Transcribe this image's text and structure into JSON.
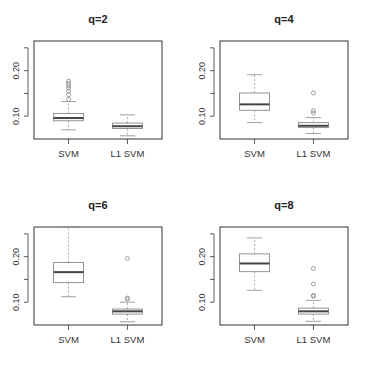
{
  "chart_data": [
    {
      "type": "boxplot",
      "title": "q=2",
      "categories": [
        "SVM",
        "L1 SVM"
      ],
      "ylim": [
        0.05,
        0.265
      ],
      "yticks": [
        0.1,
        0.15,
        0.2,
        0.25
      ],
      "ytick_labels": [
        "0.10",
        "",
        "0.20",
        ""
      ],
      "series": [
        {
          "name": "SVM",
          "whisker_low": 0.07,
          "q1": 0.09,
          "median": 0.096,
          "q3": 0.106,
          "whisker_high": 0.132,
          "outliers": [
            0.137,
            0.147,
            0.155,
            0.162,
            0.167,
            0.172,
            0.177
          ]
        },
        {
          "name": "L1 SVM",
          "whisker_low": 0.057,
          "q1": 0.073,
          "median": 0.078,
          "q3": 0.085,
          "whisker_high": 0.103,
          "outliers": []
        }
      ]
    },
    {
      "type": "boxplot",
      "title": "q=4",
      "categories": [
        "SVM",
        "L1 SVM"
      ],
      "ylim": [
        0.05,
        0.265
      ],
      "yticks": [
        0.1,
        0.15,
        0.2,
        0.25
      ],
      "ytick_labels": [
        "0.10",
        "",
        "0.20",
        ""
      ],
      "series": [
        {
          "name": "SVM",
          "whisker_low": 0.086,
          "q1": 0.113,
          "median": 0.126,
          "q3": 0.151,
          "whisker_high": 0.191,
          "outliers": []
        },
        {
          "name": "L1 SVM",
          "whisker_low": 0.062,
          "q1": 0.075,
          "median": 0.079,
          "q3": 0.086,
          "whisker_high": 0.097,
          "outliers": [
            0.107,
            0.112,
            0.151
          ]
        }
      ]
    },
    {
      "type": "boxplot",
      "title": "q=6",
      "categories": [
        "SVM",
        "L1 SVM"
      ],
      "ylim": [
        0.05,
        0.265
      ],
      "yticks": [
        0.1,
        0.15,
        0.2,
        0.25
      ],
      "ytick_labels": [
        "0.10",
        "",
        "0.20",
        ""
      ],
      "series": [
        {
          "name": "SVM",
          "whisker_low": 0.112,
          "q1": 0.143,
          "median": 0.166,
          "q3": 0.187,
          "whisker_high": 0.265,
          "outliers": []
        },
        {
          "name": "L1 SVM",
          "whisker_low": 0.057,
          "q1": 0.074,
          "median": 0.08,
          "q3": 0.085,
          "whisker_high": 0.1,
          "outliers": [
            0.107,
            0.109,
            0.196
          ]
        }
      ]
    },
    {
      "type": "boxplot",
      "title": "q=8",
      "categories": [
        "SVM",
        "L1 SVM"
      ],
      "ylim": [
        0.05,
        0.265
      ],
      "yticks": [
        0.1,
        0.15,
        0.2,
        0.25
      ],
      "ytick_labels": [
        "0.10",
        "",
        "0.20",
        ""
      ],
      "series": [
        {
          "name": "SVM",
          "whisker_low": 0.126,
          "q1": 0.167,
          "median": 0.185,
          "q3": 0.206,
          "whisker_high": 0.241,
          "outliers": []
        },
        {
          "name": "L1 SVM",
          "whisker_low": 0.058,
          "q1": 0.074,
          "median": 0.08,
          "q3": 0.087,
          "whisker_high": 0.104,
          "outliers": [
            0.113,
            0.115,
            0.14,
            0.174
          ]
        }
      ]
    }
  ],
  "panels": [
    {
      "title": "q=2",
      "x_labels": [
        "SVM",
        "L1 SVM"
      ],
      "y_labels": [
        "0.10",
        "0.20"
      ]
    },
    {
      "title": "q=4",
      "x_labels": [
        "SVM",
        "L1 SVM"
      ],
      "y_labels": [
        "0.10",
        "0.20"
      ]
    },
    {
      "title": "q=6",
      "x_labels": [
        "SVM",
        "L1 SVM"
      ],
      "y_labels": [
        "0.10",
        "0.20"
      ]
    },
    {
      "title": "q=8",
      "x_labels": [
        "SVM",
        "L1 SVM"
      ],
      "y_labels": [
        "0.10",
        "0.20"
      ]
    }
  ],
  "colors": {
    "box_stroke": "#888888",
    "median": "#444444",
    "axis": "#333333",
    "whisker": "#999999"
  }
}
